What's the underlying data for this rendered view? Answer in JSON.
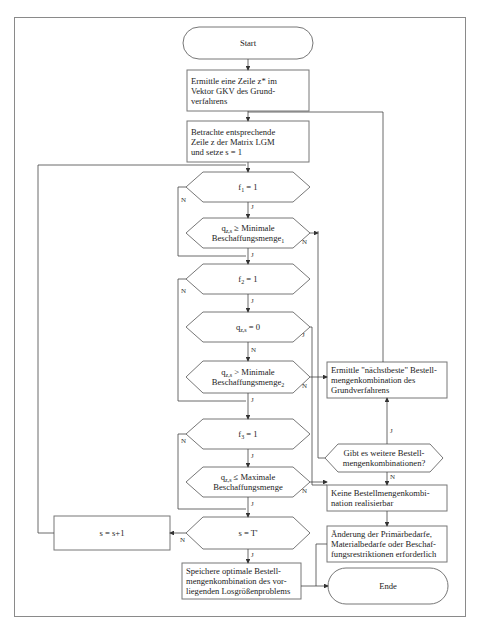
{
  "flowchart": {
    "start": "Start",
    "step1": "Ermittle eine Zeile z* im Vektor GKV des Grund-verfahrens",
    "step1_lines": [
      "Ermittle eine Zeile z* im",
      "Vektor GKV des Grund-",
      "verfahrens"
    ],
    "step2_lines": [
      "Betrachte entsprechende",
      "Zeile z der Matrix LGM",
      "und setze s = 1"
    ],
    "d_f1": {
      "main": "f",
      "sub": "1",
      "rest": " = 1"
    },
    "d_q_min1": {
      "l1_main": "q",
      "l1_sub": "z,s",
      "l1_rest": " ≥ Minimale",
      "l2_main": "Beschaffungsmenge",
      "l2_sub": "1"
    },
    "d_f2": {
      "main": "f",
      "sub": "2",
      "rest": " = 1"
    },
    "d_q0": {
      "main": "q",
      "sub": "z,s",
      "rest": " = 0"
    },
    "d_q_min2": {
      "l1_main": "q",
      "l1_sub": "z,s",
      "l1_rest": " > Minimale",
      "l2_main": "Beschaffungsmenge",
      "l2_sub": "2"
    },
    "d_f3": {
      "main": "f",
      "sub": "3",
      "rest": " = 1"
    },
    "d_q_max": {
      "l1_main": "q",
      "l1_sub": "z,s",
      "l1_rest": " ≤ Maximale",
      "l2_main": "Beschaffungsmenge"
    },
    "d_sT": "s = T'",
    "increment": "s = s+1",
    "save_lines": [
      "Speichere optimale Bestell-",
      "mengenkombination des vor-",
      "liegenden Losgrößenproblems"
    ],
    "next_best_lines": [
      "Ermittle \"nächstbeste\" Bestell-",
      "mengenkombination des",
      "Grundverfahrens"
    ],
    "more_combos_lines": [
      "Gibt es weitere Bestell-",
      "mengenkombinationen?"
    ],
    "none_lines": [
      "Keine Bestellmengenkombi-",
      "nation realisierbar"
    ],
    "change_lines": [
      "Änderung der Primärbedarfe,",
      "Materialbedarfe oder Beschaf-",
      "fungsrestriktionen erforderlich"
    ],
    "end": "Ende",
    "yes": "J",
    "no": "N"
  },
  "colors": {
    "line": "#555555",
    "box": "#777777",
    "frame": "#8a8a8a"
  }
}
